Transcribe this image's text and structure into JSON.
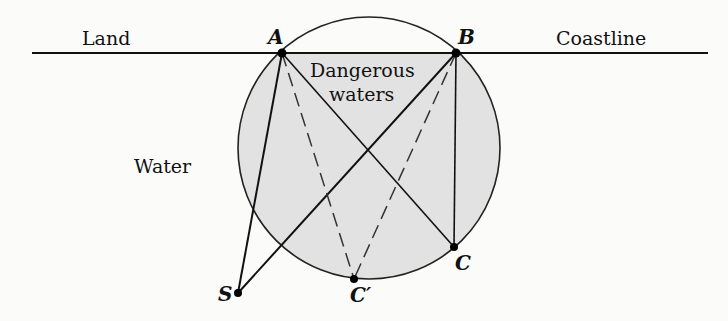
{
  "diagram": {
    "type": "geometry",
    "labels": {
      "land": "Land",
      "coastline": "Coastline",
      "danger_line1": "Dangerous",
      "danger_line2": "waters",
      "water": "Water"
    },
    "points": {
      "A": {
        "label": "A",
        "x": 282,
        "y": 53
      },
      "B": {
        "label": "B",
        "x": 456,
        "y": 53
      },
      "C": {
        "label": "C",
        "x": 454,
        "y": 247
      },
      "C_prime": {
        "label": "C′",
        "x": 354,
        "y": 279
      },
      "S": {
        "label": "S",
        "x": 238,
        "y": 293
      }
    },
    "circle": {
      "cx": 369,
      "cy": 148,
      "r": 131,
      "fill": "#e2e2e2",
      "stroke": "#222222"
    },
    "coastline": {
      "x1": 32,
      "x2": 708,
      "y": 53
    },
    "segments_solid": [
      "A-S",
      "B-S",
      "A-C",
      "B-C"
    ],
    "segments_dashed": [
      "A-C′",
      "B-C′"
    ]
  }
}
